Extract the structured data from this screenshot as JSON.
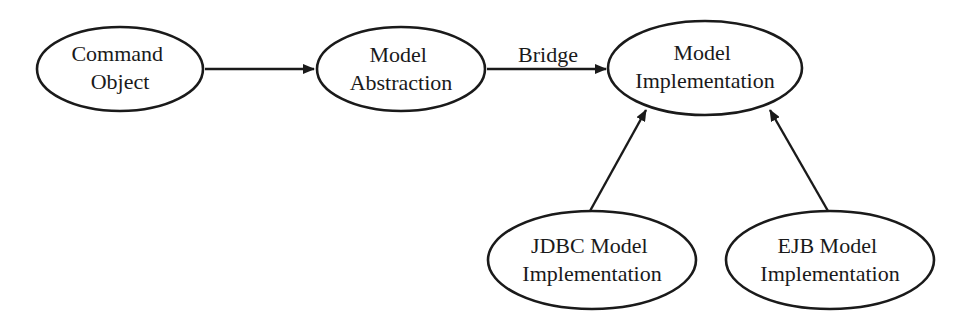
{
  "diagram": {
    "colors": {
      "stroke": "#1a1a1a",
      "background": "#ffffff",
      "text": "#1a1a1a"
    },
    "nodes": [
      {
        "id": "command_object",
        "lines": [
          "Command",
          "Object"
        ],
        "cx": 120,
        "cy": 69,
        "rx": 83,
        "ry": 42
      },
      {
        "id": "model_abstraction",
        "lines": [
          "Model",
          "Abstraction"
        ],
        "cx": 401,
        "cy": 69,
        "rx": 84,
        "ry": 42
      },
      {
        "id": "model_implementation",
        "lines": [
          "Model",
          "Implementation"
        ],
        "cx": 705,
        "cy": 68,
        "rx": 97,
        "ry": 47
      },
      {
        "id": "jdbc_model_implementation",
        "lines": [
          "JDBC Model",
          "Implementation"
        ],
        "cx": 592,
        "cy": 260,
        "rx": 104,
        "ry": 49
      },
      {
        "id": "ejb_model_implementation",
        "lines": [
          "EJB Model",
          "Implementation"
        ],
        "cx": 830,
        "cy": 260,
        "rx": 104,
        "ry": 49
      }
    ],
    "edges": [
      {
        "from": "command_object",
        "to": "model_abstraction",
        "label": ""
      },
      {
        "from": "model_abstraction",
        "to": "model_implementation",
        "label": "Bridge"
      },
      {
        "from": "jdbc_model_implementation",
        "to": "model_implementation",
        "label": ""
      },
      {
        "from": "ejb_model_implementation",
        "to": "model_implementation",
        "label": ""
      }
    ]
  }
}
